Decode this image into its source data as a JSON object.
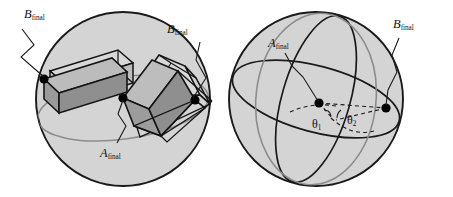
{
  "figure": {
    "background_color": "#ffffff",
    "width": 453,
    "height": 197
  },
  "colors": {
    "sphere_fill": "#d4d4d4",
    "sphere_outline": "#1a1a1a",
    "gray_circle": "#8c8c8c",
    "box_face_dark": "#8f8f8f",
    "box_face_light": "#c9c9c9",
    "box_face_mid": "#a8a8a8",
    "box_edge": "#141414",
    "dot_color": "#000000",
    "dashed_line": "#1a1a1a",
    "leader_line": "#1a1a1a"
  },
  "panels": [
    {
      "id": "left-panel",
      "name": "box-trajectory-sphere",
      "sphere": {
        "cx": 123,
        "cy": 99,
        "r": 87
      },
      "labels": [
        {
          "id": "b-final-left",
          "symbol": "B",
          "subscript": "final",
          "x": 24,
          "y": 18
        },
        {
          "id": "b-final-right",
          "symbol": "B",
          "subscript": "final",
          "x": 167,
          "y": 33
        },
        {
          "id": "a-final-center",
          "symbol": "A",
          "subscript": "final",
          "x": 100,
          "y": 152
        }
      ],
      "dots": [
        {
          "id": "dot-left",
          "cx": 44,
          "cy": 79,
          "r": 4.6
        },
        {
          "id": "dot-center",
          "cx": 123,
          "cy": 98,
          "r": 4.6
        },
        {
          "id": "dot-right",
          "cx": 195,
          "cy": 100,
          "r": 4.6
        }
      ]
    },
    {
      "id": "right-panel",
      "name": "great-circle-sphere",
      "sphere": {
        "cx": 316,
        "cy": 99,
        "r": 87
      },
      "labels": [
        {
          "id": "a-final-right-panel",
          "symbol": "A",
          "subscript": "final",
          "x": 272,
          "y": 46
        },
        {
          "id": "b-final-right-panel",
          "symbol": "B",
          "subscript": "final",
          "x": 395,
          "y": 28
        },
        {
          "id": "theta-1",
          "symbol": "θ",
          "subscript": "1",
          "x": 314,
          "y": 124
        },
        {
          "id": "theta-2",
          "symbol": "θ",
          "subscript": "2",
          "x": 349,
          "y": 120
        }
      ],
      "dots": [
        {
          "id": "dot-a-final",
          "cx": 319,
          "cy": 103,
          "r": 4.6
        },
        {
          "id": "dot-b-final",
          "cx": 386,
          "cy": 108,
          "r": 4.6
        }
      ]
    }
  ],
  "annotations": {
    "angle_1_label": "θ1",
    "angle_2_label": "θ2",
    "final_subscript": "final",
    "symbol_a": "A",
    "symbol_b": "B"
  }
}
